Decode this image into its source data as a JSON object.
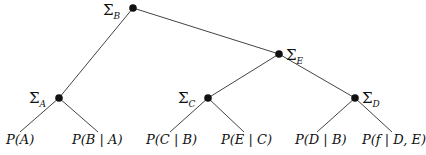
{
  "diagram": {
    "type": "tree",
    "nodes": [
      {
        "id": "B",
        "label_symbol": "Σ",
        "label_sub": "B",
        "x": 133,
        "y": 8
      },
      {
        "id": "E",
        "label_symbol": "Σ",
        "label_sub": "E",
        "x": 279,
        "y": 54
      },
      {
        "id": "A",
        "label_symbol": "Σ",
        "label_sub": "A",
        "x": 59,
        "y": 98
      },
      {
        "id": "C",
        "label_symbol": "Σ",
        "label_sub": "C",
        "x": 208,
        "y": 98
      },
      {
        "id": "D",
        "label_symbol": "Σ",
        "label_sub": "D",
        "x": 355,
        "y": 98
      }
    ],
    "leaves": [
      {
        "label": "P(A)",
        "parent": "A"
      },
      {
        "label": "P(B | A)",
        "parent": "A"
      },
      {
        "label": "P(C | B)",
        "parent": "C"
      },
      {
        "label": "P(E | C)",
        "parent": "C"
      },
      {
        "label": "P(D | B)",
        "parent": "D"
      },
      {
        "label": "P(f | D, E)",
        "parent": "D"
      }
    ],
    "edges": [
      [
        "B",
        "A"
      ],
      [
        "B",
        "E"
      ],
      [
        "E",
        "C"
      ],
      [
        "E",
        "D"
      ],
      [
        "A",
        "P(A)"
      ],
      [
        "A",
        "P(B | A)"
      ],
      [
        "C",
        "P(C | B)"
      ],
      [
        "C",
        "P(E | C)"
      ],
      [
        "D",
        "P(D | B)"
      ],
      [
        "D",
        "P(f | D, E)"
      ]
    ]
  }
}
